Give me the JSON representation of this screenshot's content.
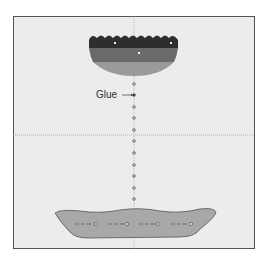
{
  "diagram": {
    "labels": {
      "glue": "Glue"
    },
    "colors": {
      "background": "#ececec",
      "border": "#555555",
      "top_layer_dark": "#2e2e2e",
      "top_layer_mid": "#6a6a6a",
      "top_layer_light": "#9a9a9a",
      "bottom_shape": "#a8a8a8",
      "guide_line": "#999999"
    },
    "top_piece": {
      "layers": 3,
      "markers": 3
    },
    "glue_dots": 12,
    "bottom_piece": {
      "markers": 4
    }
  }
}
